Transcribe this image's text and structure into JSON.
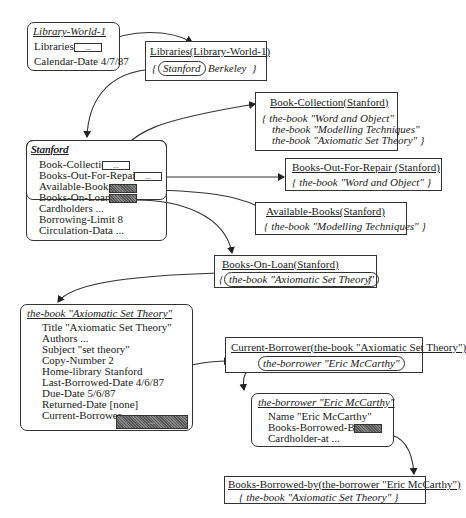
{
  "library_world": {
    "title": "Library-World-1",
    "libraries_label": "Libraries",
    "libraries_value": "...",
    "calendar_label": "Calendar-Date 4/7/87"
  },
  "libraries_collection": {
    "title": "Libraries(Library-World-1)",
    "open_brace": "{",
    "item_selected": "Stanford",
    "item_other": "Berkeley",
    "close_brace": "}"
  },
  "book_collection": {
    "title": "Book-Collection(Stanford)",
    "lines": [
      "{  the-book \"Word and Object\"",
      "the-book \"Modelling Techniques\"",
      "the-book \"Axiomatic Set Theory\"  }"
    ]
  },
  "stanford": {
    "title": "Stanford",
    "slots": [
      {
        "label": "Book-Collection",
        "value": "..."
      },
      {
        "label": "Books-Out-For-Repair",
        "value": "..."
      },
      {
        "label": "Available-Books",
        "value": ""
      },
      {
        "label": "Books-On-Loan",
        "value": ""
      },
      {
        "label": "Cardholders ..."
      },
      {
        "label": "Borrowing-Limit 8"
      },
      {
        "label": "Circulation-Data  ..."
      }
    ]
  },
  "books_out_for_repair": {
    "title": "Books-Out-For-Repair (Stanford)",
    "content": "{ the-book \"Word and Object\"  }"
  },
  "available_books": {
    "title": "Available-Books(Stanford)",
    "content": "{ the-book \"Modelling Techniques\"  }"
  },
  "books_on_loan": {
    "title": "Books-On-Loan(Stanford)",
    "open_brace": "{",
    "item": "the-book \"Axiomatic Set Theory\"",
    "close_brace": "}"
  },
  "book_frame": {
    "title": "the-book \"Axiomatic Set Theory\"",
    "slots": [
      "Title \"Axiomatic Set Theory\"",
      "Authors ...",
      "Subject \"set theory\"",
      "Copy-Number 2",
      "Home-library Stanford",
      "Last-Borrowed-Date  4/6/87",
      "Due-Date  5/6/87",
      "Returned-Date  [none]",
      "Current-Borrower"
    ],
    "current_borrower_value": "..."
  },
  "current_borrower": {
    "title": "Current-Borrower(the-book \"Axiomatic Set Theory\")",
    "item": "the-borrower \"Eric McCarthy\""
  },
  "borrower_frame": {
    "title": "the-borrower \"Eric McCarthy\"",
    "slots": [
      "Name \"Eric McCarthy\"",
      "Books-Borrowed-By",
      "Cardholder-at ..."
    ]
  },
  "books_borrowed_by": {
    "title": "Books-Borrowed-by(the-borrower \"Eric McCarthy\")",
    "content": "{ the-book \"Axiomatic Set Theory\"  }"
  }
}
